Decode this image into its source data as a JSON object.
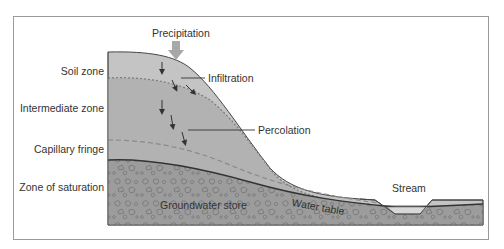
{
  "diagram": {
    "title_arrow_label": "Precipitation",
    "zones": [
      {
        "id": "soil",
        "label": "Soil zone"
      },
      {
        "id": "intermediate",
        "label": "Intermediate zone"
      },
      {
        "id": "capillary",
        "label": "Capillary fringe"
      },
      {
        "id": "saturation",
        "label": "Zone of saturation"
      }
    ],
    "process_labels": {
      "infiltration": "Infiltration",
      "percolation": "Percolation"
    },
    "features": {
      "stream": "Stream",
      "groundwater": "Groundwater store",
      "water_table": "Water table"
    },
    "colors": {
      "soil": "#c4c4c4",
      "intermediate": "#b2b2b2",
      "saturation": "#9c9c9c",
      "stream_water": "#d8d8d8",
      "arrow": "#a8a8a8",
      "outline": "#444444",
      "frame": "#9a9a9a"
    }
  }
}
